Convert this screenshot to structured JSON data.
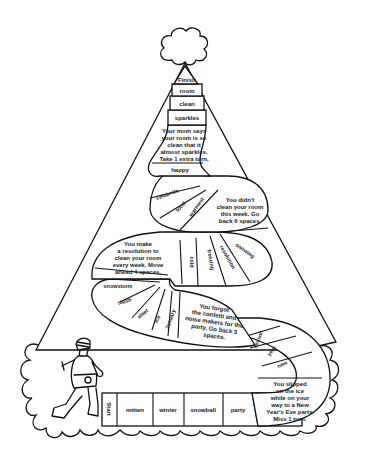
{
  "game": {
    "theme": "party-hat board game",
    "colors": {
      "ink": "#111111",
      "paper": "#ffffff"
    },
    "spaces": [
      {
        "id": 0,
        "label": "Start"
      },
      {
        "id": 1,
        "label": "mitten"
      },
      {
        "id": 2,
        "label": "winter"
      },
      {
        "id": 3,
        "label": "snowball"
      },
      {
        "id": 4,
        "label": "party"
      },
      {
        "id": 5,
        "label": "You slipped on the ice while on your way to a New Year's Eve party. Miss 1 turn."
      },
      {
        "id": 6,
        "label": "new"
      },
      {
        "id": 7,
        "label": "year"
      },
      {
        "id": 8,
        "label": "season"
      },
      {
        "id": 9,
        "label": "You forgot the confetti and noise makers for the party. Go back 3 spaces."
      },
      {
        "id": 10,
        "label": "January"
      },
      {
        "id": 11,
        "label": "ice"
      },
      {
        "id": 12,
        "label": "sleet"
      },
      {
        "id": 13,
        "label": "slush"
      },
      {
        "id": 14,
        "label": "snowstorm"
      },
      {
        "id": 15,
        "label": "You make a resolution to clean your room every week. Move ahead 4 spaces."
      },
      {
        "id": 16,
        "label": "cold"
      },
      {
        "id": 17,
        "label": "freezing"
      },
      {
        "id": 18,
        "label": "resolution"
      },
      {
        "id": 19,
        "label": "snowing"
      },
      {
        "id": 20,
        "label": "You didn't clean your room this week. Go back 6 spaces."
      },
      {
        "id": 21,
        "label": "warmest"
      },
      {
        "id": 22,
        "label": "food"
      },
      {
        "id": 23,
        "label": "celebrate"
      },
      {
        "id": 24,
        "label": "happy"
      },
      {
        "id": 25,
        "label": "Your mom says your room is so clean that it almost sparkles. Take 1 extra turn."
      },
      {
        "id": 26,
        "label": "sparkles"
      },
      {
        "id": 27,
        "label": "clean"
      },
      {
        "id": 28,
        "label": "room"
      },
      {
        "id": 29,
        "label": "Finish"
      }
    ],
    "lines": {
      "s5": [
        "You slipped",
        "on the ice",
        "while on your",
        "way to a New",
        "Year's Eve party.",
        "Miss 1 turn."
      ],
      "s9": [
        "You forgot",
        "the confetti and",
        "noise makers for the",
        "party. Go back 3",
        "spaces."
      ],
      "s15": [
        "You make",
        "a resolution to",
        "clean your room",
        "every week. Move",
        "ahead 4 spaces."
      ],
      "s20": [
        "You didn't",
        "clean your room",
        "this week. Go",
        "back 6 spaces."
      ],
      "s25": [
        "Your mom says",
        "your room is so",
        "clean that it",
        "almost sparkles.",
        "Take 1 extra turn."
      ]
    },
    "illustrations": [
      "child-in-winter-clothes-icon",
      "pom-pom-icon",
      "cloud-brim-icon"
    ]
  }
}
